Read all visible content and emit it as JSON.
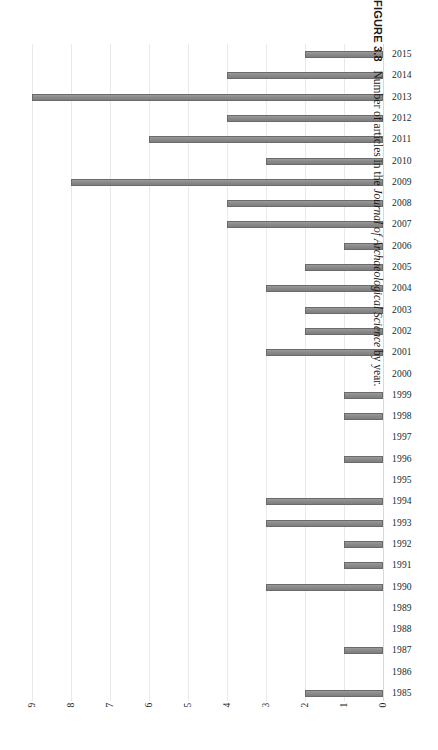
{
  "figure": {
    "label": "FIGURE 3.8",
    "caption_pre": "Number of articles in the ",
    "caption_italic": "Journal of Archaeological Science",
    "caption_post": " by year."
  },
  "axis": {
    "xticks": [
      "9",
      "8",
      "7",
      "6",
      "5",
      "4",
      "3",
      "2",
      "1",
      "0"
    ],
    "reversed": true,
    "xmin": 0,
    "xmax": 9
  },
  "style": {
    "bar_fill": "#8c8c8c",
    "bar_stroke": "#6a6a6a",
    "gridline": "#e9e9e9",
    "text": "#201f1f",
    "background": "#ffffff"
  },
  "chart_data": {
    "type": "bar",
    "orientation": "horizontal",
    "title": "",
    "xlabel": "",
    "ylabel": "",
    "xlim": [
      0,
      9
    ],
    "x_axis_reversed": true,
    "grid": true,
    "legend": null,
    "categories": [
      "2015",
      "2014",
      "2013",
      "2012",
      "2011",
      "2010",
      "2009",
      "2008",
      "2007",
      "2006",
      "2005",
      "2004",
      "2003",
      "2002",
      "2001",
      "2000",
      "1999",
      "1998",
      "1997",
      "1996",
      "1995",
      "1994",
      "1993",
      "1992",
      "1991",
      "1990",
      "1989",
      "1988",
      "1987",
      "1986",
      "1985"
    ],
    "values": [
      2,
      4,
      9,
      4,
      6,
      3,
      8,
      4,
      4,
      1,
      2,
      3,
      2,
      2,
      3,
      0,
      1,
      1,
      0,
      1,
      0,
      3,
      3,
      1,
      1,
      3,
      0,
      0,
      1,
      0,
      2
    ],
    "xtick_labels": [
      "9",
      "8",
      "7",
      "6",
      "5",
      "4",
      "3",
      "2",
      "1",
      "0"
    ],
    "caption": "FIGURE 3.8   Number of articles in the Journal of Archaeological Science by year."
  }
}
